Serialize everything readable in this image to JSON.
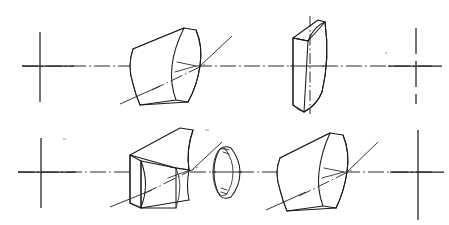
{
  "document": {
    "title": "Cylindrical Lens Elements — Oblique Projection Drawing",
    "caption": "Technical line drawing: two rows of cylindrical optical elements arranged along dash-dot optical axes, terminated by crosshair reference marks.",
    "drawing_type": "engineering-line-drawing",
    "projection": "oblique",
    "background_color": "#ffffff",
    "line_color": "#1a1a1a",
    "centerline_color": "#2b2b2b",
    "width_px": 449,
    "height_px": 225
  },
  "figure": {
    "rows": [
      {
        "id": "upper-row",
        "label": "Upper optical train",
        "axis_y": 66,
        "axis": {
          "label": "Optical axis (upper)",
          "style": "dash-dot",
          "x_start": 22,
          "x_end": 432
        },
        "crossmarks": [
          {
            "id": "upper-left-crossmark",
            "label": "Left reference crossmark",
            "cx": 40,
            "cy": 66,
            "arm_h": 34,
            "arm_v": 42,
            "vertical_style": "solid"
          },
          {
            "id": "upper-right-crossmark",
            "label": "Right reference crossmark",
            "cx": 416,
            "cy": 66,
            "arm_h": 30,
            "arm_v": 40,
            "vertical_style": "dashed"
          }
        ],
        "elements": [
          {
            "id": "upper-lens-1",
            "label": "Plano-convex cylindrical lens",
            "type": "cylindrical-lens-convex",
            "orientation": "oblique-wide",
            "center_x": 165,
            "center_y": 66,
            "oblique_axis": "true"
          },
          {
            "id": "upper-lens-2",
            "label": "Cylindrical lens, edge-on narrow",
            "type": "cylindrical-lens-convex-narrow",
            "orientation": "near-edge-on",
            "center_x": 310,
            "center_y": 64,
            "oblique_axis": "false"
          }
        ]
      },
      {
        "id": "lower-row",
        "label": "Lower optical train",
        "axis_y": 172,
        "axis": {
          "label": "Optical axis (lower)",
          "style": "dash-dot",
          "x_start": 18,
          "x_end": 432
        },
        "crossmarks": [
          {
            "id": "lower-left-crossmark",
            "label": "Left reference crossmark",
            "cx": 41,
            "cy": 172,
            "arm_h": 34,
            "arm_v": 40,
            "vertical_style": "solid"
          },
          {
            "id": "lower-right-crossmark",
            "label": "Right reference crossmark",
            "cx": 418,
            "cy": 172,
            "arm_h": 30,
            "arm_v": 46,
            "vertical_style": "solid"
          }
        ],
        "elements": [
          {
            "id": "lower-lens-1",
            "label": "Plano-concave cylindrical lens",
            "type": "cylindrical-lens-concave",
            "orientation": "oblique-wide",
            "center_x": 165,
            "center_y": 172,
            "oblique_axis": "true"
          },
          {
            "id": "lower-disc",
            "label": "Thin annular disc element",
            "type": "annular-disc",
            "orientation": "near-edge-on",
            "center_x": 228,
            "center_y": 172,
            "oblique_axis": "false"
          },
          {
            "id": "lower-lens-2",
            "label": "Plano-convex cylindrical lens",
            "type": "cylindrical-lens-convex",
            "orientation": "oblique-wide",
            "center_x": 320,
            "center_y": 172,
            "oblique_axis": "true"
          }
        ]
      }
    ]
  }
}
